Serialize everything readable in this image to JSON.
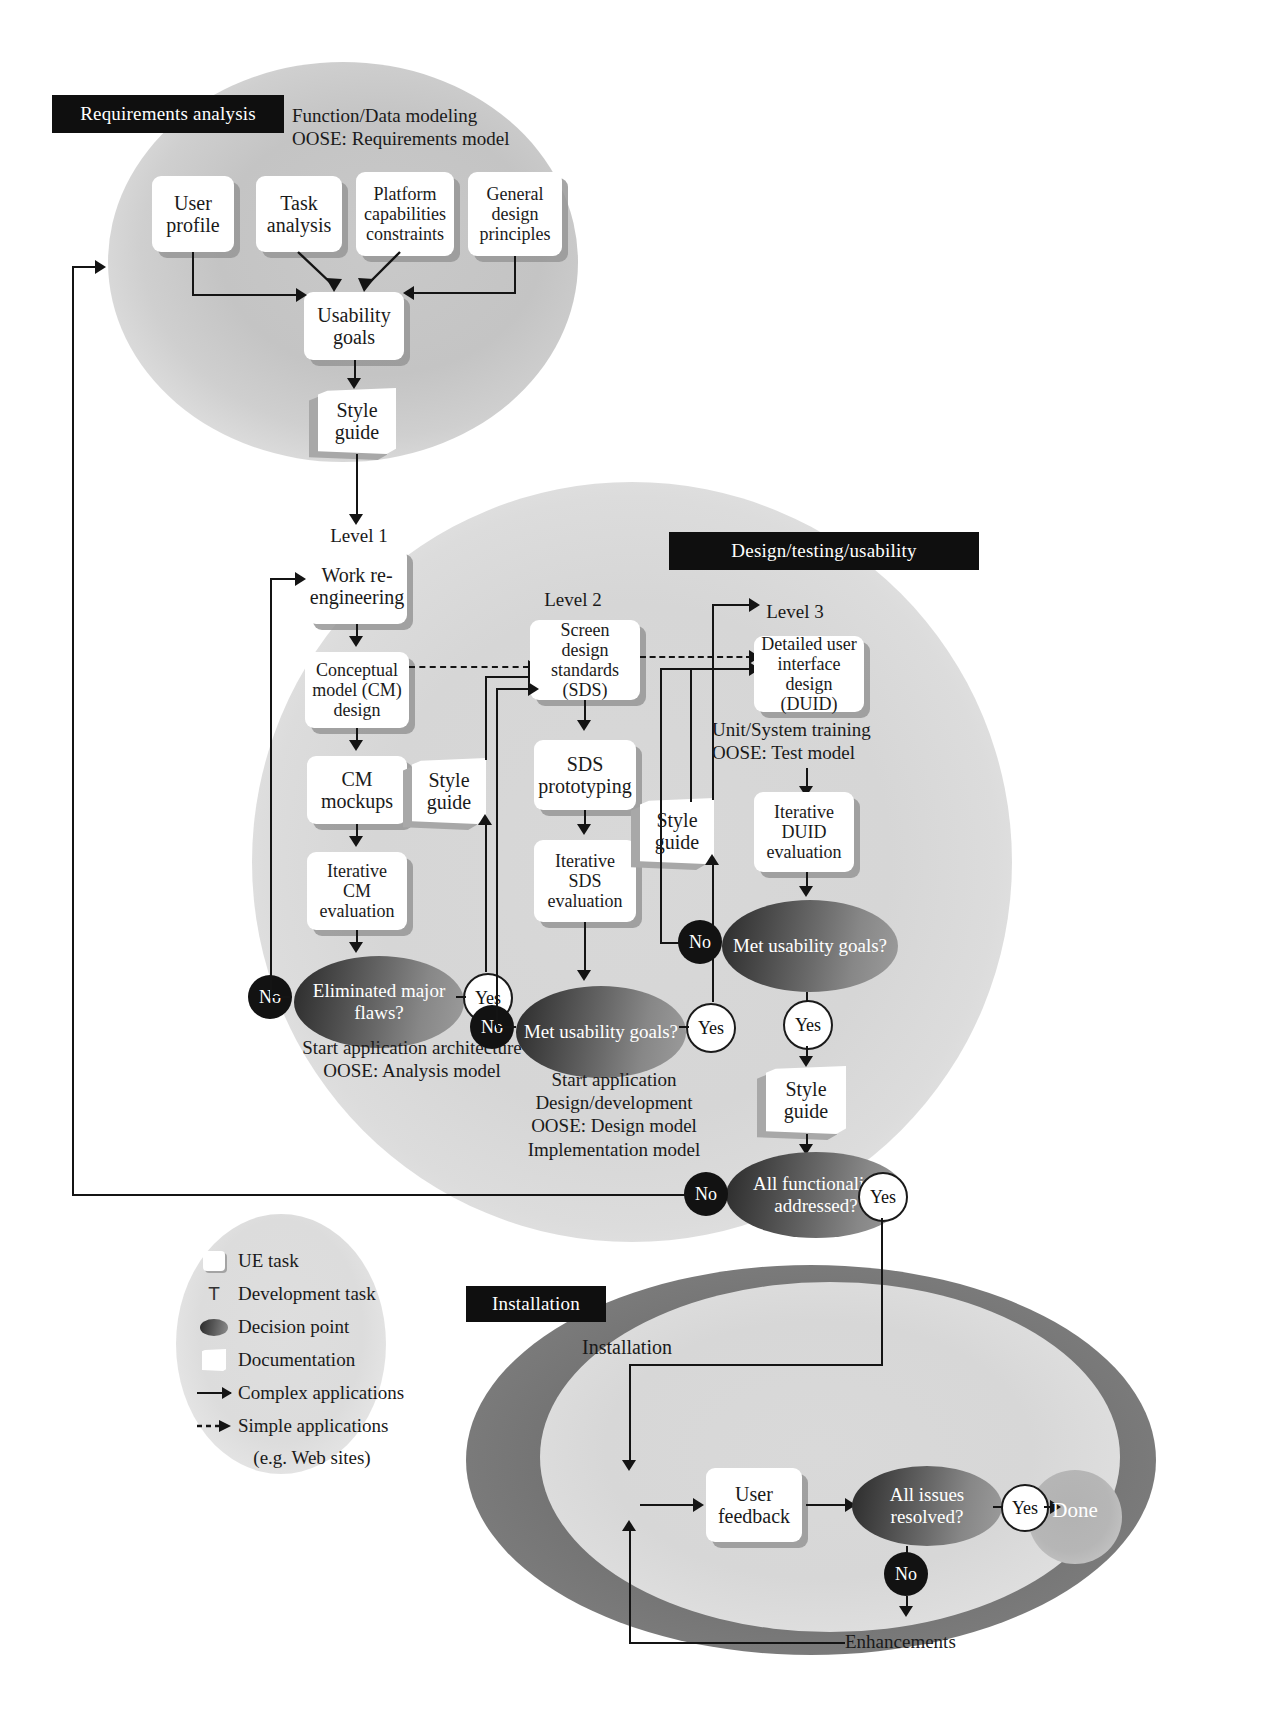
{
  "diagram": {
    "page_number": ""
  },
  "phases": {
    "requirements": {
      "banner": "Requirements analysis",
      "side_note": "Function/Data modeling\nOOSE: Requirements model",
      "boxes": [
        {
          "label": "User\nprofile"
        },
        {
          "label": "Task\nanalysis"
        },
        {
          "label": "Platform\ncapabilities\nconstraints"
        },
        {
          "label": "General\ndesign\nprinciples"
        }
      ],
      "goal_box": "Usability\ngoals",
      "style_guide": "Style\nguide"
    },
    "design": {
      "banner": "Design/testing/usability",
      "level1": {
        "title": "Level 1",
        "boxes": [
          "Work\nre-\nengineering",
          "Conceptual\nmodel (CM)\ndesign",
          "CM\nmockups",
          "Iterative\nCM\nevaluation"
        ],
        "decision": "Eliminated\nmajor flaws?",
        "style_guide": "Style\nguide",
        "note": "Start application architecture\nOOSE: Analysis model",
        "yes": "Yes",
        "no": "No"
      },
      "level2": {
        "title": "Level 2",
        "boxes": [
          "Screen design\nstandards\n(SDS)",
          "SDS\nprototyping",
          "Iterative\nSDS\nevaluation"
        ],
        "decision": "Met\nusability goals?",
        "style_guide": "Style\nguide",
        "note": "Start application\nDesign/development\nOOSE: Design model\nImplementation model",
        "yes": "Yes",
        "no": "No"
      },
      "level3": {
        "title": "Level 3",
        "boxes": [
          "Detailed user\ninterface\ndesign (DUID)",
          "Iterative\nDUID\nevaluation"
        ],
        "side_note": "Unit/System training\nOOSE: Test model",
        "decision": "Met\nusability goals?",
        "style_guide": "Style\nguide",
        "yes": "Yes",
        "no": "No"
      },
      "final_decision": {
        "label": "All functionality\naddressed?",
        "yes": "Yes",
        "no": "No"
      }
    },
    "installation": {
      "banner": "Installation",
      "start_label": "Installation",
      "feedback_box": "User\nfeedback",
      "decision": "All issues\nresolved?",
      "yes": "Yes",
      "no": "No",
      "done": "Done",
      "enhancements": "Enhancements"
    }
  },
  "legend": {
    "items": [
      {
        "icon": "ue-task-icon",
        "label": "UE task"
      },
      {
        "icon": "development-task-icon",
        "label": "Development task",
        "glyph": "T"
      },
      {
        "icon": "decision-point-icon",
        "label": "Decision point"
      },
      {
        "icon": "documentation-icon",
        "label": "Documentation"
      },
      {
        "icon": "solid-arrow-icon",
        "label": "Complex applications"
      },
      {
        "icon": "dashed-arrow-icon",
        "label": "Simple applications"
      }
    ],
    "footnote": "(e.g. Web sites)"
  }
}
